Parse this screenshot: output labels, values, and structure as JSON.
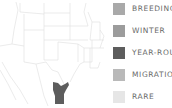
{
  "map": {
    "region": "central-southern-united-states-and-northern-mexico",
    "state_border_color": "#dcdcdc",
    "range_color": "#5d5d5d",
    "range_type": "year-round"
  },
  "legend": {
    "items": [
      {
        "label": "BREEDING",
        "color": "#a9a9a9",
        "top": 3
      },
      {
        "label": "WINTER",
        "color": "#9c9c9c",
        "top": 25
      },
      {
        "label": "YEAR-ROUND",
        "color": "#5d5d5d",
        "top": 47
      },
      {
        "label": "MIGRATION",
        "color": "#b9b9b9",
        "top": 69
      },
      {
        "label": "RARE",
        "color": "#e6e6e6",
        "top": 91
      }
    ]
  }
}
